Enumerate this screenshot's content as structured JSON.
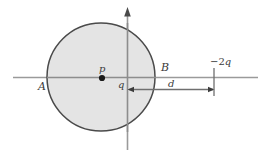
{
  "figure": {
    "type": "physics-diagram",
    "colors": {
      "background": "#ffffff",
      "circle_fill": "#e2e2e2",
      "circle_stroke": "#4a4a4a",
      "axis": "#9a9a9a",
      "dimension_line": "#6f6f6f",
      "point_marker": "#1a1a1a",
      "label_text": "#3a3a3a"
    },
    "circle": {
      "center_x": 101,
      "center_y": 77,
      "radius": 54
    },
    "axes": {
      "horizontal": {
        "y": 77,
        "x_start": 13,
        "x_end": 258
      },
      "vertical": {
        "x": 127,
        "y_start": 10,
        "y_end": 150,
        "arrow": "up"
      }
    },
    "dimension": {
      "y": 89,
      "x_start": 128,
      "x_end": 214,
      "arrowheads": "both",
      "tick_x": 214,
      "tick_y_start": 68,
      "tick_y_end": 96
    },
    "markers": [
      {
        "name": "charge-p-dot",
        "x": 102,
        "y": 78,
        "r": 3
      },
      {
        "name": "dimension-left-arrowhead",
        "x": 130,
        "y": 89
      },
      {
        "name": "dimension-right-arrowhead",
        "x": 212,
        "y": 89
      }
    ],
    "labels": {
      "A": "A",
      "B": "B",
      "p": "p",
      "q": "q",
      "d": "d",
      "neg_two_q_sign": "−2",
      "neg_two_q_var": "q"
    }
  }
}
